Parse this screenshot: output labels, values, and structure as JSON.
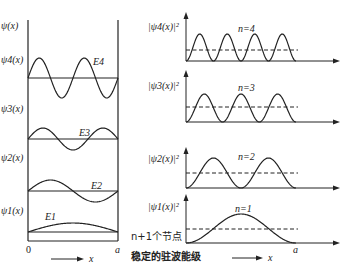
{
  "diagram": {
    "title": "稳定的驻波能级",
    "left_panel": {
      "axis_label": "ψ(x)",
      "origin_label": "0",
      "right_wall_label": "a",
      "x_arrow_label": "x",
      "levels": [
        {
          "n": 4,
          "psi_label": "ψ4(x)",
          "energy_label": "E4"
        },
        {
          "n": 3,
          "psi_label": "ψ3(x)",
          "energy_label": "E3"
        },
        {
          "n": 2,
          "psi_label": "ψ2(x)",
          "energy_label": "E2"
        },
        {
          "n": 1,
          "psi_label": "ψ1(x)",
          "energy_label": "E1"
        }
      ]
    },
    "right_panel": {
      "levels": [
        {
          "n": 4,
          "prob_label": "|ψ4(x)|²",
          "n_label": "n=4"
        },
        {
          "n": 3,
          "prob_label": "|ψ3(x)|²",
          "n_label": "n=3"
        },
        {
          "n": 2,
          "prob_label": "|ψ2(x)|²",
          "n_label": "n=2"
        },
        {
          "n": 1,
          "prob_label": "|ψ1(x)|²",
          "n_label": "n=1"
        }
      ],
      "end_label": "a",
      "x_arrow_label": "x"
    },
    "nodes_note": "n+1个节点",
    "caption": "稳定的驻波能级"
  }
}
